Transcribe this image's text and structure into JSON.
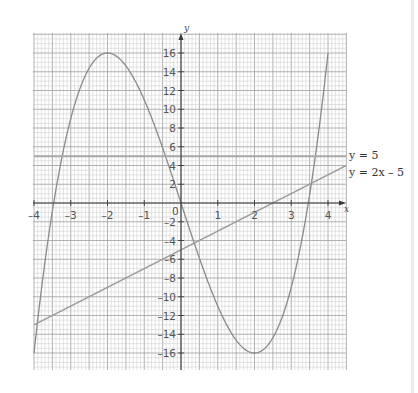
{
  "chart_data": {
    "type": "line",
    "title": "",
    "xlabel": "x",
    "ylabel": "y",
    "xlim": [
      -4,
      4
    ],
    "ylim": [
      -16,
      16
    ],
    "grid": true,
    "x_ticks": [
      -4,
      -3,
      -2,
      -1,
      0,
      1,
      2,
      3,
      4
    ],
    "x_tick_labels": [
      "–4",
      "–3",
      "–2",
      "–1",
      "0",
      "1",
      "2",
      "3",
      "4"
    ],
    "y_ticks": [
      16,
      14,
      12,
      10,
      8,
      6,
      4,
      2,
      -2,
      -4,
      -6,
      -8,
      -10,
      -12,
      -14,
      -16
    ],
    "y_tick_labels": [
      "16",
      "14",
      "12",
      "10",
      "8",
      "6",
      "4",
      "2",
      "–2",
      "–4",
      "–6",
      "–8",
      "–10",
      "–12",
      "–14",
      "–16"
    ],
    "series": [
      {
        "name": "y = x³ – 12x",
        "kind": "curve",
        "x": [
          -4,
          -3.5,
          -3,
          -2.5,
          -2,
          -1.5,
          -1,
          -0.5,
          0,
          0.5,
          1,
          1.5,
          2,
          2.5,
          3,
          3.5,
          4
        ],
        "y": [
          -16,
          -0.875,
          9,
          14.375,
          16,
          14.625,
          11,
          5.875,
          0,
          -5.875,
          -11,
          -14.625,
          -16,
          -14.375,
          -9,
          0.875,
          16
        ],
        "color": "#8a8a8a"
      },
      {
        "name": "y = 5",
        "kind": "line",
        "x": [
          -4,
          4.5
        ],
        "y": [
          5,
          5
        ],
        "color": "#a8a8a8",
        "label": "y = 5"
      },
      {
        "name": "y = 2x – 5",
        "kind": "line",
        "x": [
          -4,
          4.5
        ],
        "y": [
          -13,
          4
        ],
        "color": "#9a9a9a",
        "label": "y = 2x – 5"
      }
    ],
    "legend_position": "right-inline"
  },
  "labels": {
    "x_axis_name": "x",
    "y_axis_name": "y",
    "line_y5": "y = 5",
    "line_2x": "y = 2x – 5"
  },
  "colors": {
    "grid_minor": "#c9c9c9",
    "grid_major": "#9e9e9e",
    "axis": "#3a3a3a",
    "curve": "#8a8a8a"
  }
}
